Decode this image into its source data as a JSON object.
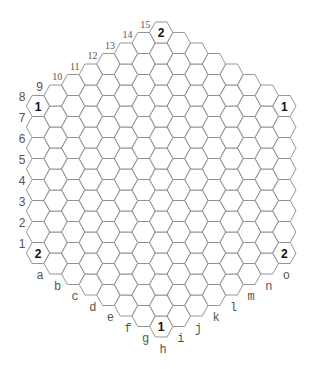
{
  "board": {
    "type": "hex-hex",
    "side": 8,
    "columns": [
      "a",
      "b",
      "c",
      "d",
      "e",
      "f",
      "g",
      "h",
      "i",
      "j",
      "k",
      "l",
      "m",
      "n",
      "o"
    ],
    "rows": [
      "1",
      "2",
      "3",
      "4",
      "5",
      "6",
      "7",
      "8",
      "9",
      "10",
      "11",
      "12",
      "13",
      "14",
      "15"
    ],
    "colors": {
      "stroke": "#8a8a8a",
      "fill": "#ffffff",
      "label": "#555555",
      "number": "#111111"
    },
    "marked_cells": [
      {
        "cell": "a8",
        "col": 0,
        "row": 8,
        "value": "1"
      },
      {
        "cell": "h15",
        "col": 7,
        "row": 15,
        "value": "2"
      },
      {
        "cell": "o15",
        "col": 14,
        "row": 15,
        "value": "1"
      },
      {
        "cell": "a1",
        "col": 0,
        "row": 1,
        "value": "2"
      },
      {
        "cell": "o8",
        "col": 14,
        "row": 8,
        "value": "2"
      },
      {
        "cell": "h1",
        "col": 7,
        "row": 1,
        "value": "1"
      }
    ]
  }
}
